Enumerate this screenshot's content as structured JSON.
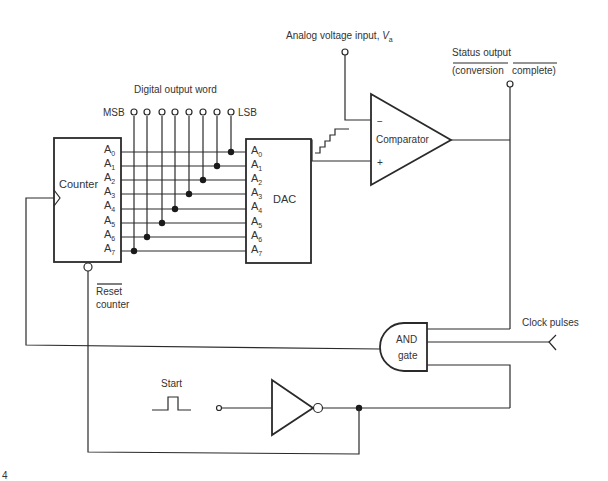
{
  "diagram": {
    "labels": {
      "analog_input": "Analog voltage input, ",
      "analog_input_var": "V",
      "analog_input_sub": "a",
      "status_output_line1": "Status output",
      "status_output_line2a": "(conversion",
      "status_output_line2b": "complete)",
      "digital_output_word": "Digital output word",
      "msb": "MSB",
      "lsb": "LSB",
      "counter": "Counter",
      "dac": "DAC",
      "comparator": "Comparator",
      "comparator_minus": "−",
      "comparator_plus": "+",
      "reset_line1": "Reset",
      "reset_line2": "counter",
      "and_line1": "AND",
      "and_line2": "gate",
      "clock_pulses": "Clock pulses",
      "start": "Start",
      "corner_mark": "4"
    },
    "pins": [
      "A",
      "A",
      "A",
      "A",
      "A",
      "A",
      "A",
      "A"
    ],
    "pin_subs": [
      "0",
      "1",
      "2",
      "3",
      "4",
      "5",
      "6",
      "7"
    ],
    "colors": {
      "line": "#2a2a2a",
      "text": "#333333",
      "background": "#ffffff"
    }
  }
}
